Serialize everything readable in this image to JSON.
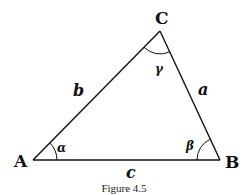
{
  "figure": {
    "caption": "Figure 4.5",
    "colors": {
      "stroke": "#111111",
      "background": "#ffffff"
    },
    "vertices": {
      "A": {
        "label": "A",
        "x": 33,
        "y": 160
      },
      "B": {
        "label": "B",
        "x": 220,
        "y": 160
      },
      "C": {
        "label": "C",
        "x": 160,
        "y": 31
      }
    },
    "sides": {
      "a": {
        "label": "a",
        "between": "B-C"
      },
      "b": {
        "label": "b",
        "between": "A-C"
      },
      "c": {
        "label": "c",
        "between": "A-B"
      }
    },
    "angles": {
      "alpha": {
        "label": "α",
        "at": "A"
      },
      "beta": {
        "label": "β",
        "at": "B"
      },
      "gamma": {
        "label": "γ",
        "at": "C"
      }
    }
  }
}
